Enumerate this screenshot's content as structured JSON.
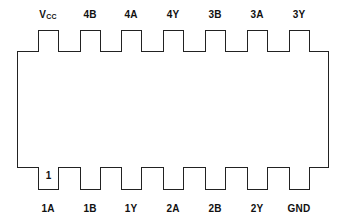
{
  "diagram": {
    "type": "dip-14-pinout",
    "top_pins": [
      {
        "label": "V",
        "sub": "CC"
      },
      {
        "label": "4B",
        "sub": ""
      },
      {
        "label": "4A",
        "sub": ""
      },
      {
        "label": "4Y",
        "sub": ""
      },
      {
        "label": "3B",
        "sub": ""
      },
      {
        "label": "3A",
        "sub": ""
      },
      {
        "label": "3Y",
        "sub": ""
      }
    ],
    "bottom_pins": [
      {
        "label": "1A",
        "number": "1"
      },
      {
        "label": "1B",
        "number": ""
      },
      {
        "label": "1Y",
        "number": ""
      },
      {
        "label": "2A",
        "number": ""
      },
      {
        "label": "2B",
        "number": ""
      },
      {
        "label": "2Y",
        "number": ""
      },
      {
        "label": "GND",
        "number": ""
      }
    ]
  }
}
